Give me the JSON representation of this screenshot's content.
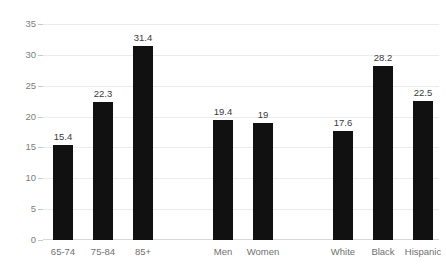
{
  "chart_data": {
    "type": "bar",
    "title": "",
    "subtitle": "",
    "xlabel": "",
    "ylabel": "",
    "ylim": [
      0,
      35
    ],
    "yticks": [
      0,
      5,
      10,
      15,
      20,
      25,
      30,
      35
    ],
    "ytick_labels": [
      "0",
      "5",
      "10",
      "15",
      "20",
      "25",
      "30",
      "35"
    ],
    "grid": true,
    "legend": "none",
    "orientation": "vertical",
    "bar_color": "#111111",
    "gridline_color": "#ebebeb",
    "tick_label_color": "#7d7d7d",
    "value_label_color": "#3a3a3a",
    "categories": [
      "65-74",
      "75-84",
      "85+",
      "",
      "Men",
      "Women",
      "",
      "White",
      "Black",
      "Hispanic"
    ],
    "values": [
      15.4,
      22.3,
      31.4,
      null,
      19.4,
      19,
      null,
      17.6,
      28.2,
      22.5
    ],
    "value_labels": [
      "15.4",
      "22.3",
      "31.4",
      "",
      "19.4",
      "19",
      "",
      "17.6",
      "28.2",
      "22.5"
    ],
    "groups": [
      {
        "name": "age",
        "categories": [
          "65-74",
          "75-84",
          "85+"
        ],
        "values": [
          15.4,
          22.3,
          31.4
        ]
      },
      {
        "name": "sex",
        "categories": [
          "Men",
          "Women"
        ],
        "values": [
          19.4,
          19
        ]
      },
      {
        "name": "race",
        "categories": [
          "White",
          "Black",
          "Hispanic"
        ],
        "values": [
          17.6,
          28.2,
          22.5
        ]
      }
    ],
    "bars": [
      {
        "label": "65-74",
        "value": 15.4,
        "value_label": "15.4",
        "slot": 0
      },
      {
        "label": "75-84",
        "value": 22.3,
        "value_label": "22.3",
        "slot": 1
      },
      {
        "label": "85+",
        "value": 31.4,
        "value_label": "31.4",
        "slot": 2
      },
      {
        "label": "Men",
        "value": 19.4,
        "value_label": "19.4",
        "slot": 4
      },
      {
        "label": "Women",
        "value": 19,
        "value_label": "19",
        "slot": 5
      },
      {
        "label": "White",
        "value": 17.6,
        "value_label": "17.6",
        "slot": 7
      },
      {
        "label": "Black",
        "value": 28.2,
        "value_label": "28.2",
        "slot": 8
      },
      {
        "label": "Hispanic",
        "value": 22.5,
        "value_label": "22.5",
        "slot": 9
      }
    ]
  }
}
